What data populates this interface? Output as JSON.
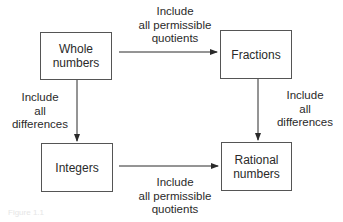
{
  "diagram": {
    "nodes": {
      "whole_numbers": {
        "line1": "Whole",
        "line2": "numbers"
      },
      "fractions": {
        "line1": "Fractions"
      },
      "integers": {
        "line1": "Integers"
      },
      "rational_numbers": {
        "line1": "Rational",
        "line2": "numbers"
      }
    },
    "edges": {
      "whole_to_fractions": {
        "line1": "Include",
        "line2": "all permissible",
        "line3": "quotients"
      },
      "whole_to_integers": {
        "line1": "Include",
        "line2": "all",
        "line3": "differences"
      },
      "fractions_to_rational": {
        "line1": "Include",
        "line2": "all",
        "line3": "differences"
      },
      "integers_to_rational": {
        "line1": "Include",
        "line2": "all permissible",
        "line3": "quotients"
      }
    },
    "caption": "Figure 1.1",
    "colors": {
      "line": "#2a2a2a",
      "box_border": "#555555",
      "text": "#2a2a2a"
    }
  }
}
